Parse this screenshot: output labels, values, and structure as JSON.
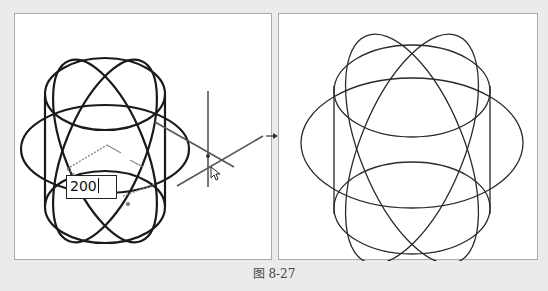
{
  "figure": {
    "caption": "图 8-27"
  },
  "left_panel": {
    "description": "Cylinder-like wireframe of intersecting ellipses with 3D move/copy gizmo",
    "dimension_input": {
      "value": "200"
    },
    "colors": {
      "stroke": "#1a1a1a",
      "gizmo": "#555555",
      "dashed_guide": "#8a8a8a"
    }
  },
  "right_panel": {
    "description": "Result wireframe after operation: stacked and rotated ellipses",
    "colors": {
      "stroke": "#2a2a2a"
    }
  },
  "arrow": {
    "direction": "right",
    "icon": "arrow-right-icon"
  }
}
